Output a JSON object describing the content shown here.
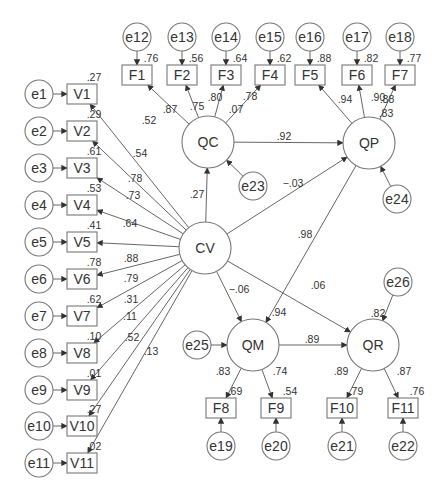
{
  "diagram": {
    "type": "structural-equation-model",
    "colors": {
      "stroke": "#777777",
      "text": "#333333",
      "background": "#ffffff"
    },
    "latent_factors": [
      {
        "id": "CV",
        "label": "CV",
        "x": 205,
        "y": 248
      },
      {
        "id": "QC",
        "label": "QC",
        "x": 208,
        "y": 142
      },
      {
        "id": "QP",
        "label": "QP",
        "x": 369,
        "y": 143
      },
      {
        "id": "QM",
        "label": "QM",
        "x": 253,
        "y": 345
      },
      {
        "id": "QR",
        "label": "QR",
        "x": 373,
        "y": 345
      }
    ],
    "indicators": [
      {
        "id": "V1",
        "label": "V1",
        "x": 82,
        "y": 94,
        "r2": ".27",
        "error": "e1",
        "loading": ".52",
        "factor": "CV"
      },
      {
        "id": "V2",
        "label": "V2",
        "x": 82,
        "y": 131,
        "r2": ".29",
        "error": "e2",
        "loading": ".54",
        "factor": "CV"
      },
      {
        "id": "V3",
        "label": "V3",
        "x": 82,
        "y": 168,
        "r2": ".61",
        "error": "e3",
        "loading": ".78",
        "factor": "CV"
      },
      {
        "id": "V4",
        "label": "V4",
        "x": 82,
        "y": 205,
        "r2": ".53",
        "error": "e4",
        "loading": ".73",
        "factor": "CV"
      },
      {
        "id": "V5",
        "label": "V5",
        "x": 82,
        "y": 242,
        "r2": ".41",
        "error": "e5",
        "loading": ".64",
        "factor": "CV"
      },
      {
        "id": "V6",
        "label": "V6",
        "x": 82,
        "y": 279,
        "r2": ".78",
        "error": "e6",
        "loading": ".88",
        "factor": "CV"
      },
      {
        "id": "V7",
        "label": "V7",
        "x": 82,
        "y": 316,
        "r2": ".62",
        "error": "e7",
        "loading": ".79",
        "factor": "CV"
      },
      {
        "id": "V8",
        "label": "V8",
        "x": 82,
        "y": 353,
        "r2": ".10",
        "error": "e8",
        "loading": ".31",
        "factor": "CV"
      },
      {
        "id": "V9",
        "label": "V9",
        "x": 82,
        "y": 390,
        "r2": ".01",
        "error": "e9",
        "loading": ".11",
        "factor": "CV"
      },
      {
        "id": "V10",
        "label": "V10",
        "x": 82,
        "y": 426,
        "r2": ".27",
        "error": "e10",
        "loading": ".52",
        "factor": "CV"
      },
      {
        "id": "V11",
        "label": "V11",
        "x": 82,
        "y": 463,
        "r2": ".02",
        "error": "e11",
        "loading": ".13",
        "factor": "CV"
      },
      {
        "id": "F1",
        "label": "F1",
        "x": 137,
        "y": 75,
        "r2": ".76",
        "error": "e12",
        "loading": ".87",
        "factor": "QC"
      },
      {
        "id": "F2",
        "label": "F2",
        "x": 182,
        "y": 75,
        "r2": ".56",
        "error": "e13",
        "loading": ".75",
        "factor": "QC"
      },
      {
        "id": "F3",
        "label": "F3",
        "x": 226,
        "y": 75,
        "r2": ".64",
        "error": "e14",
        "loading": ".80",
        "factor": "QC"
      },
      {
        "id": "F4",
        "label": "F4",
        "x": 270,
        "y": 75,
        "r2": ".62",
        "error": "e15",
        "loading": ".78",
        "factor": "QC"
      },
      {
        "id": "F5",
        "label": "F5",
        "x": 310,
        "y": 75,
        "r2": ".88",
        "error": "e16",
        "loading": ".94",
        "factor": "QP"
      },
      {
        "id": "F6",
        "label": "F6",
        "x": 357,
        "y": 75,
        "r2": ".82",
        "error": "e17",
        "loading": ".90",
        "factor": "QP"
      },
      {
        "id": "F7",
        "label": "F7",
        "x": 400,
        "y": 75,
        "r2": ".77",
        "error": "e18",
        "loading": ".88",
        "factor": "QP"
      },
      {
        "id": "F8",
        "label": "F8",
        "x": 221,
        "y": 408,
        "r2": ".69",
        "error": "e19",
        "loading": ".83",
        "factor": "QM"
      },
      {
        "id": "F9",
        "label": "F9",
        "x": 276,
        "y": 408,
        "r2": ".54",
        "error": "e20",
        "loading": ".74",
        "factor": "QM"
      },
      {
        "id": "F10",
        "label": "F10",
        "x": 342,
        "y": 408,
        "r2": ".79",
        "error": "e21",
        "loading": ".89",
        "factor": "QR"
      },
      {
        "id": "F11",
        "label": "F11",
        "x": 403,
        "y": 408,
        "r2": ".76",
        "error": "e22",
        "loading": ".87",
        "factor": "QR"
      }
    ],
    "error_terms": [
      {
        "id": "e1",
        "label": "e1",
        "x": 39,
        "y": 94
      },
      {
        "id": "e2",
        "label": "e2",
        "x": 39,
        "y": 131
      },
      {
        "id": "e3",
        "label": "e3",
        "x": 39,
        "y": 168
      },
      {
        "id": "e4",
        "label": "e4",
        "x": 39,
        "y": 205
      },
      {
        "id": "e5",
        "label": "e5",
        "x": 39,
        "y": 242
      },
      {
        "id": "e6",
        "label": "e6",
        "x": 39,
        "y": 279
      },
      {
        "id": "e7",
        "label": "e7",
        "x": 39,
        "y": 316
      },
      {
        "id": "e8",
        "label": "e8",
        "x": 39,
        "y": 353
      },
      {
        "id": "e9",
        "label": "e9",
        "x": 39,
        "y": 390
      },
      {
        "id": "e10",
        "label": "e10",
        "x": 39,
        "y": 426
      },
      {
        "id": "e11",
        "label": "e11",
        "x": 39,
        "y": 463
      },
      {
        "id": "e12",
        "label": "e12",
        "x": 137,
        "y": 37
      },
      {
        "id": "e13",
        "label": "e13",
        "x": 182,
        "y": 37
      },
      {
        "id": "e14",
        "label": "e14",
        "x": 226,
        "y": 37
      },
      {
        "id": "e15",
        "label": "e15",
        "x": 270,
        "y": 37
      },
      {
        "id": "e16",
        "label": "e16",
        "x": 310,
        "y": 37
      },
      {
        "id": "e17",
        "label": "e17",
        "x": 357,
        "y": 37
      },
      {
        "id": "e18",
        "label": "e18",
        "x": 400,
        "y": 37
      },
      {
        "id": "e19",
        "label": "e19",
        "x": 221,
        "y": 446
      },
      {
        "id": "e20",
        "label": "e20",
        "x": 276,
        "y": 446
      },
      {
        "id": "e21",
        "label": "e21",
        "x": 342,
        "y": 446
      },
      {
        "id": "e22",
        "label": "e22",
        "x": 403,
        "y": 446
      },
      {
        "id": "e23",
        "label": "e23",
        "x": 253,
        "y": 186
      },
      {
        "id": "e24",
        "label": "e24",
        "x": 397,
        "y": 199
      },
      {
        "id": "e25",
        "label": "e25",
        "x": 197,
        "y": 345
      },
      {
        "id": "e26",
        "label": "e26",
        "x": 398,
        "y": 282
      }
    ],
    "structural_paths": [
      {
        "from": "CV",
        "to": "QC",
        "coef": "27",
        "label": ".27"
      },
      {
        "from": "QC",
        "to": "QP",
        "label": ".92"
      },
      {
        "from": "CV",
        "to": "QP",
        "label": "−.03"
      },
      {
        "from": "QP",
        "to": "QM",
        "label": ".98"
      },
      {
        "from": "CV",
        "to": "QM",
        "label": "−.06"
      },
      {
        "from": "CV",
        "to": "QR",
        "label": ".06"
      },
      {
        "from": "QM",
        "to": "QR",
        "label": ".89"
      },
      {
        "from": "e23",
        "to": "QC"
      },
      {
        "from": "e24",
        "to": "QP"
      },
      {
        "from": "e25",
        "to": "QM"
      },
      {
        "from": "e26",
        "to": "QR"
      }
    ],
    "extra_labels": [
      {
        "id": "qc-f3-extra",
        "text": ".07",
        "note": "label near QC→F3/F4 paths"
      }
    ],
    "r_squared_latent": [
      {
        "factor": "QP",
        "label": ".83"
      },
      {
        "factor": "QM",
        "label": ".94"
      },
      {
        "factor": "QR",
        "label": ".82"
      }
    ]
  }
}
